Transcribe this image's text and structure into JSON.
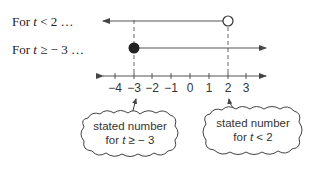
{
  "rows": [
    {
      "prefix": "For ",
      "var": "t",
      "relation": " < 2 …",
      "full": "For t < 2 …"
    },
    {
      "prefix": "For ",
      "var": "t",
      "relation": " ≥ − 3 …",
      "full": "For t ≥ − 3 …"
    }
  ],
  "number_line": {
    "ticks": [
      "−4",
      "−3",
      "−2",
      "−1",
      "0",
      "1",
      "2",
      "3"
    ],
    "tick_values": [
      -4,
      -3,
      -2,
      -1,
      0,
      1,
      2,
      3
    ]
  },
  "rays": [
    {
      "condition": "t < 2",
      "endpoint": 2,
      "endpoint_style": "open",
      "direction": "left"
    },
    {
      "condition": "t ≥ −3",
      "endpoint": -3,
      "endpoint_style": "closed",
      "direction": "right"
    }
  ],
  "callouts": [
    {
      "line1": "stated number",
      "line2_prefix": "for ",
      "line2_var": "t",
      "line2_rel": " ≥ − 3",
      "points_to": -3
    },
    {
      "line1": "stated number",
      "line2_prefix": "for ",
      "line2_var": "t",
      "line2_rel": " < 2",
      "points_to": 2
    }
  ],
  "colors": {
    "line": "#555555",
    "dot": "#222222",
    "text": "#222222"
  }
}
